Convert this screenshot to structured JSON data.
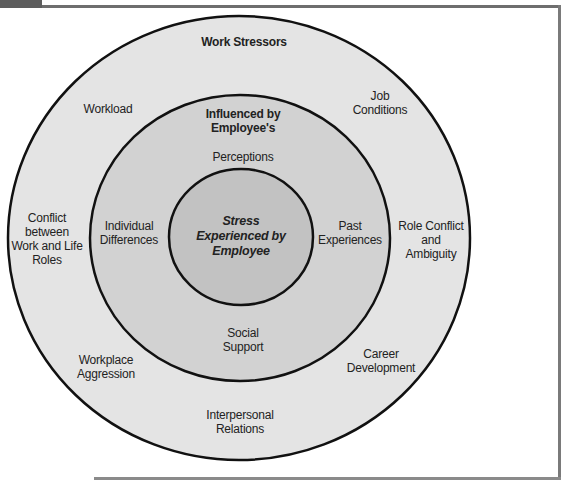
{
  "diagram": {
    "type": "concentric-circles",
    "colors": {
      "outer_fill": "#e4e4e4",
      "middle_fill": "#d2d2d2",
      "inner_fill": "#c2c2c2",
      "stroke": "#111111",
      "frame": "#6e6e6e"
    },
    "outer_ring": {
      "title": "Work Stressors",
      "items": [
        {
          "id": "workload",
          "label": "Workload"
        },
        {
          "id": "job-conditions",
          "label": "Job\nConditions"
        },
        {
          "id": "conflict-work-life",
          "label": "Conflict\nbetween\nWork and Life\nRoles"
        },
        {
          "id": "role-conflict",
          "label": "Role Conflict\nand\nAmbiguity"
        },
        {
          "id": "workplace-aggression",
          "label": "Workplace\nAggression"
        },
        {
          "id": "career-development",
          "label": "Career\nDevelopment"
        },
        {
          "id": "interpersonal-relations",
          "label": "Interpersonal\nRelations"
        }
      ]
    },
    "middle_ring": {
      "title": "Influenced by\nEmployee's",
      "items": [
        {
          "id": "perceptions",
          "label": "Perceptions"
        },
        {
          "id": "individual-differences",
          "label": "Individual\nDifferences"
        },
        {
          "id": "past-experiences",
          "label": "Past\nExperiences"
        },
        {
          "id": "social-support",
          "label": "Social\nSupport"
        }
      ]
    },
    "center": {
      "label": "Stress\nExperienced by\nEmployee"
    }
  }
}
